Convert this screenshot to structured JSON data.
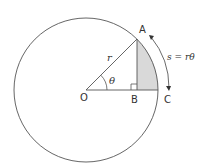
{
  "diagram": {
    "colors": {
      "stroke": "#555555",
      "fill_region": "#d9d9d9",
      "text": "#333333",
      "background": "#ffffff"
    },
    "points": {
      "O": {
        "label": "O",
        "x": 86,
        "y": 90
      },
      "A": {
        "label": "A",
        "x": 137,
        "y": 39
      },
      "B": {
        "label": "B",
        "x": 137,
        "y": 90
      },
      "C": {
        "label": "C",
        "x": 158,
        "y": 90
      }
    },
    "labels": {
      "O": "O",
      "A": "A",
      "B": "B",
      "C": "C",
      "radius": "r",
      "angle": "θ",
      "arc_formula": "s = rθ"
    },
    "circle": {
      "cx": 86,
      "cy": 90,
      "r": 72
    },
    "annotations": {
      "right_angle_at": "B",
      "shaded_region": "segment between AB and arc AC",
      "double_arrow": "along arc from A to C"
    }
  }
}
